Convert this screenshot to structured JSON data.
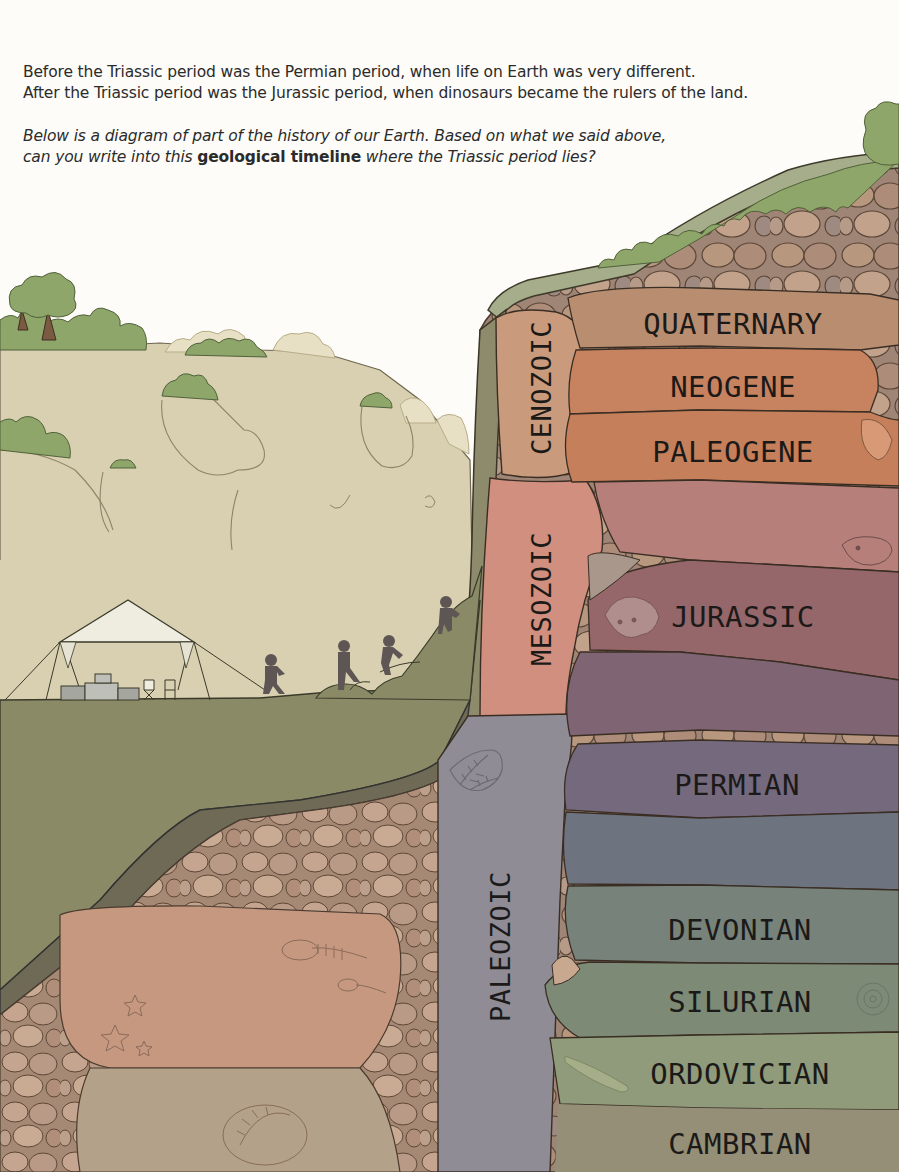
{
  "intro": {
    "line1": "Before the Triassic period was the Permian period, when life on Earth was very different.",
    "line2": "After the Triassic period was the Jurassic period, when dinosaurs became the rulers of the land.",
    "question_part1": "Below is a diagram of part of the history of our Earth. Based on what we said above,",
    "question_part2a": "can you write into this ",
    "question_bold": "geological timeline",
    "question_part2b": " where the Triassic period lies?"
  },
  "eras": [
    {
      "name": "CENOZOIC",
      "color": "#c99a7c"
    },
    {
      "name": "MESOZOIC",
      "color": "#d08f7f"
    },
    {
      "name": "PALEOZOIC",
      "color": "#8f8c95"
    }
  ],
  "periods": [
    {
      "label": "QUATERNARY",
      "era": "CENOZOIC",
      "color": "#b98d70"
    },
    {
      "label": "NEOGENE",
      "era": "CENOZOIC",
      "color": "#c7825f"
    },
    {
      "label": "PALEOGENE",
      "era": "CENOZOIC",
      "color": "#c57f5a"
    },
    {
      "label": "",
      "era": "MESOZOIC",
      "color": "#b67f79",
      "note": "blank band (unlabeled)"
    },
    {
      "label": "JURASSIC",
      "era": "MESOZOIC",
      "color": "#95676a"
    },
    {
      "label": "",
      "era": "MESOZOIC",
      "color": "#7f6573",
      "note": "blank band (unlabeled, Triassic answer slot)"
    },
    {
      "label": "PERMIAN",
      "era": "PALEOZOIC",
      "color": "#75697e"
    },
    {
      "label": "",
      "era": "PALEOZOIC",
      "color": "#6e7380",
      "note": "blank band (unlabeled)"
    },
    {
      "label": "DEVONIAN",
      "era": "PALEOZOIC",
      "color": "#77827a"
    },
    {
      "label": "SILURIAN",
      "era": "PALEOZOIC",
      "color": "#7c8a76"
    },
    {
      "label": "ORDOVICIAN",
      "era": "PALEOZOIC",
      "color": "#8f9b7a"
    },
    {
      "label": "CAMBRIAN",
      "era": "PALEOZOIC",
      "color": "#948f76"
    }
  ],
  "scene": {
    "elements": [
      "tent",
      "supply-boxes",
      "folding-chairs",
      "four-hikers",
      "cliff",
      "trees",
      "fossils"
    ]
  }
}
